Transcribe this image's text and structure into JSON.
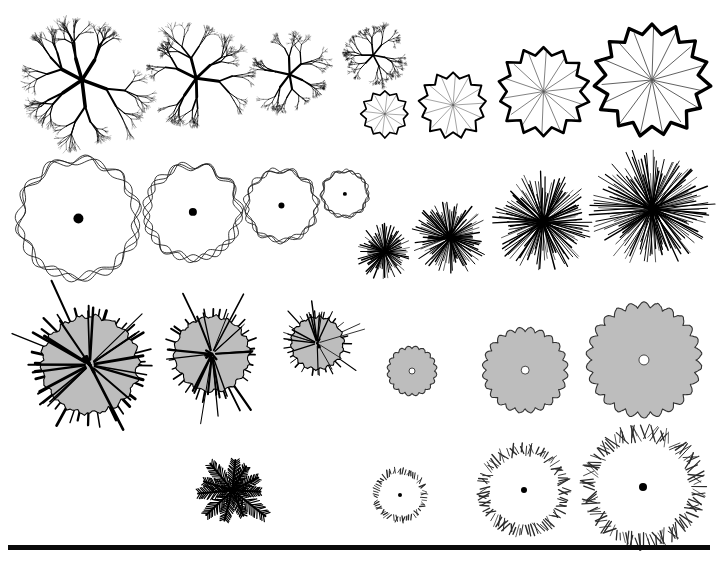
{
  "sheet": {
    "title": "Plan-View Tree Symbol Reference Sheet",
    "background_color": "#ffffff",
    "ink_color": "#000000",
    "fill_gray": "#bdbdbd",
    "width": 718,
    "height": 563
  },
  "bottom_rule": {
    "name": "horizontal-rule",
    "x": 8,
    "y": 545,
    "width": 702,
    "height": 5,
    "color": "#0a0a0a"
  },
  "symbol_groups": [
    {
      "id": "branching-deciduous",
      "label": "Branching Deciduous Tree",
      "style": "fractal-branch",
      "row": 1,
      "side": "left",
      "stroke_color": "#000000",
      "items": [
        {
          "name": "branching-deciduous-xl",
          "cx": 82,
          "cy": 80,
          "r": 64
        },
        {
          "name": "branching-deciduous-lg",
          "cx": 196,
          "cy": 78,
          "r": 52
        },
        {
          "name": "branching-deciduous-md",
          "cx": 290,
          "cy": 75,
          "r": 40
        },
        {
          "name": "branching-deciduous-sm",
          "cx": 373,
          "cy": 55,
          "r": 30
        }
      ]
    },
    {
      "id": "scalloped-spoke",
      "label": "Scalloped Canopy with Radial Spokes",
      "style": "scalloped-polygon",
      "row": 1,
      "side": "right",
      "stroke_color": "#000000",
      "spoke_color": "#4a4a4a",
      "items": [
        {
          "name": "scalloped-spoke-sm",
          "cx": 385,
          "cy": 114,
          "r": 24,
          "lobes": 12
        },
        {
          "name": "scalloped-spoke-md",
          "cx": 453,
          "cy": 105,
          "r": 34,
          "lobes": 13
        },
        {
          "name": "scalloped-spoke-lg",
          "cx": 544,
          "cy": 92,
          "r": 46,
          "lobes": 14
        },
        {
          "name": "scalloped-spoke-xl",
          "cx": 652,
          "cy": 80,
          "r": 58,
          "lobes": 15
        }
      ]
    },
    {
      "id": "wavy-outline",
      "label": "Wavy Double-Outline Canopy",
      "style": "looping-outline",
      "row": 2,
      "side": "left",
      "stroke_color": "#1a1a1a",
      "center_dot": true,
      "items": [
        {
          "name": "wavy-outline-xl",
          "cx": 78,
          "cy": 218,
          "r": 62,
          "dot": 5
        },
        {
          "name": "wavy-outline-lg",
          "cx": 193,
          "cy": 212,
          "r": 49,
          "dot": 4
        },
        {
          "name": "wavy-outline-md",
          "cx": 281,
          "cy": 205,
          "r": 37,
          "dot": 3
        },
        {
          "name": "wavy-outline-sm",
          "cx": 345,
          "cy": 194,
          "r": 24,
          "dot": 2
        }
      ]
    },
    {
      "id": "starburst",
      "label": "Dense Radial Starburst Canopy",
      "style": "radial-burst",
      "row": 2,
      "side": "right",
      "stroke_color": "#000000",
      "items": [
        {
          "name": "starburst-sm",
          "cx": 385,
          "cy": 252,
          "r": 28,
          "rays": 70
        },
        {
          "name": "starburst-md",
          "cx": 450,
          "cy": 238,
          "r": 38,
          "rays": 90
        },
        {
          "name": "starburst-lg",
          "cx": 543,
          "cy": 222,
          "r": 50,
          "rays": 110
        },
        {
          "name": "starburst-xl",
          "cx": 652,
          "cy": 209,
          "r": 62,
          "rays": 130
        }
      ]
    },
    {
      "id": "spiky-conifer",
      "label": "Spiky Needled Canopy, Gray Fill",
      "style": "spiky-blob",
      "row": 3,
      "side": "left",
      "stroke_color": "#000000",
      "fill_color": "#bdbdbd",
      "items": [
        {
          "name": "spiky-conifer-lg",
          "cx": 90,
          "cy": 365,
          "r": 52,
          "spikes": 34
        },
        {
          "name": "spiky-conifer-md",
          "cx": 212,
          "cy": 354,
          "r": 40,
          "spikes": 30
        },
        {
          "name": "spiky-conifer-sm",
          "cx": 317,
          "cy": 343,
          "r": 28,
          "spikes": 26
        }
      ]
    },
    {
      "id": "lobed-cloud",
      "label": "Lobed Cloud Canopy, Gray Fill",
      "style": "lobed-blob",
      "row": 3,
      "side": "right",
      "stroke_color": "#333333",
      "fill_color": "#bdbdbd",
      "items": [
        {
          "name": "lobed-cloud-sm",
          "cx": 412,
          "cy": 371,
          "r": 25,
          "lobes": 20,
          "dot": 3
        },
        {
          "name": "lobed-cloud-md",
          "cx": 525,
          "cy": 370,
          "r": 43,
          "lobes": 24,
          "dot": 4
        },
        {
          "name": "lobed-cloud-lg",
          "cx": 644,
          "cy": 360,
          "r": 58,
          "lobes": 26,
          "dot": 5
        }
      ]
    },
    {
      "id": "palm",
      "label": "Palm Tree, Plan View",
      "style": "palm-fronds",
      "row": 4,
      "side": "left",
      "stroke_color": "#000000",
      "items": [
        {
          "name": "palm-single",
          "cx": 232,
          "cy": 490,
          "r": 42,
          "fronds": 11
        }
      ]
    },
    {
      "id": "hatched-ring",
      "label": "Hatched Ring Canopy",
      "style": "hatch-ring",
      "row": 4,
      "side": "right",
      "stroke_color": "#2b2b2b",
      "items": [
        {
          "name": "hatched-ring-sm",
          "cx": 400,
          "cy": 495,
          "r": 25,
          "ticks": 60,
          "tick_len": 5,
          "dot": 2
        },
        {
          "name": "hatched-ring-md",
          "cx": 524,
          "cy": 490,
          "r": 42,
          "ticks": 95,
          "tick_len": 9,
          "dot": 3
        },
        {
          "name": "hatched-ring-lg",
          "cx": 643,
          "cy": 487,
          "r": 56,
          "ticks": 120,
          "tick_len": 12,
          "dot": 4
        }
      ]
    }
  ]
}
